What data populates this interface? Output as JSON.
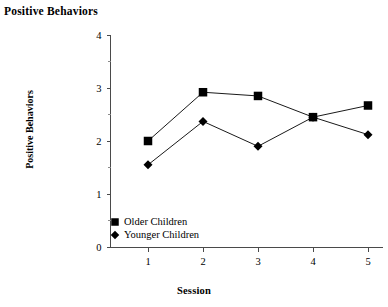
{
  "chart_data": {
    "type": "line",
    "title": "Positive Behaviors",
    "xlabel": "Session",
    "ylabel": "Positive Behaviors",
    "categories": [
      "1",
      "2",
      "3",
      "4",
      "5"
    ],
    "x": [
      1,
      2,
      3,
      4,
      5
    ],
    "xlim": [
      0.3,
      5.3
    ],
    "ylim": [
      0,
      4
    ],
    "y_ticks": [
      "0",
      "1",
      "2",
      "3",
      "4"
    ],
    "y_tick_values": [
      0,
      1,
      2,
      3,
      4
    ],
    "y_minor_tick_values": [
      0.5,
      1.5,
      2.5,
      3.5
    ],
    "grid": false,
    "legend_position": "inside-bottom-left",
    "series": [
      {
        "name": "Older Children",
        "marker": "square",
        "color": "#000000",
        "values": [
          2.0,
          2.92,
          2.85,
          2.45,
          2.67
        ]
      },
      {
        "name": "Younger Children",
        "marker": "diamond",
        "color": "#000000",
        "values": [
          1.55,
          2.37,
          1.9,
          2.45,
          2.12
        ]
      }
    ]
  },
  "legend": {
    "items": [
      {
        "label": "Older Children",
        "marker": "square"
      },
      {
        "label": "Younger Children",
        "marker": "diamond"
      }
    ]
  }
}
